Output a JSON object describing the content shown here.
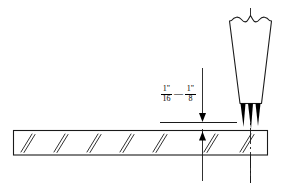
{
  "diagram": {
    "canvas": {
      "width": 283,
      "height": 189,
      "background": "#ffffff"
    },
    "line_color": "#1a1a1a",
    "flame_color": "#000000",
    "dimension": {
      "name": "standoff-gap",
      "min": {
        "numerator": "1\"",
        "denominator": "16"
      },
      "separator": "—",
      "max": {
        "numerator": "1\"",
        "denominator": "8"
      },
      "full_text": "1\"/16 — 1\"/8",
      "units": "inch"
    },
    "parts": {
      "workpiece_label": "steel-plate",
      "torch_label": "cutting-torch",
      "flame_label": "flame-cones",
      "flame_cone_count": 3,
      "hatch_count": 7,
      "reference_line_label": "standoff-reference-line",
      "centerline_label": "torch-centerline"
    }
  }
}
